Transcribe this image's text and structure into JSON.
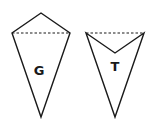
{
  "shapes": [
    {
      "name": "kite",
      "label": "G"
    },
    {
      "name": "dart",
      "label": "T"
    }
  ],
  "colors": {
    "stroke": "#1a1a1a",
    "background": "#ffffff"
  }
}
